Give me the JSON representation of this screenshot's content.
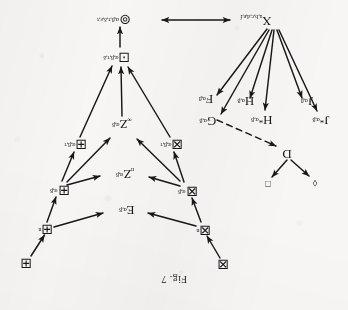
{
  "figure": {
    "caption": "Fig. 7",
    "orientation_degrees": 180,
    "ink_color": "#17171a",
    "paper_color": "#f7f6f4"
  },
  "nodes": {
    "box_x_top": {
      "symbol": "⊠",
      "sup": "",
      "sub": ""
    },
    "box_x_n": {
      "symbol": "⊠",
      "sup": "n",
      "sub": ""
    },
    "box_x_ab": {
      "symbol": "⊠",
      "sup": "α,β",
      "sub": ""
    },
    "box_x_abt": {
      "symbol": "⊠",
      "sup": "α,β,τ",
      "sub": ""
    },
    "box_plus_top": {
      "symbol": "⊞",
      "sup": "",
      "sub": ""
    },
    "box_plus_n": {
      "symbol": "⊞",
      "sup": "n",
      "sub": ""
    },
    "box_plus_ab": {
      "symbol": "⊞",
      "sup": "α,β",
      "sub": ""
    },
    "box_plus_abt": {
      "symbol": "⊞",
      "sup": "α,β,τ",
      "sub": ""
    },
    "e_ab": {
      "symbol": "E",
      "sup": "α,β",
      "sub": ""
    },
    "z_n_ab": {
      "symbol": "Z",
      "sup": "α,β",
      "sub": "n"
    },
    "z_inf_ab": {
      "symbol": "Z",
      "sup": "α,β",
      "sub": "∞"
    },
    "box_dot": {
      "symbol": "⊡",
      "sup": "α,β,τ,δ",
      "sub": ""
    },
    "circ_dot": {
      "symbol": "⊚",
      "sup": "α,β,τ,δ,ε,τ",
      "sub": ""
    },
    "x_node": {
      "symbol": "X",
      "sup": "",
      "sub": "a,b,c,d,e,f"
    },
    "d_node": {
      "symbol": "D",
      "sup": "",
      "sub": ""
    },
    "diamond_small": {
      "symbol": "◊",
      "sup": "",
      "sub": ""
    },
    "square_small": {
      "symbol": "□",
      "sup": "",
      "sub": ""
    },
    "f_ab": {
      "symbol": "F",
      "sup": "α,β",
      "sub": ""
    },
    "g_ab": {
      "symbol": "G",
      "sup": "α,β",
      "sub": ""
    },
    "h_ab": {
      "symbol": "H",
      "sup": "α,β",
      "sub": ""
    },
    "h_star_ab": {
      "symbol": "H*",
      "sup": "α,β",
      "sub": ""
    },
    "j_ab": {
      "symbol": "J",
      "sup": "α,β",
      "sub": ""
    },
    "j_star_ab": {
      "symbol": "J*",
      "sup": "α,β",
      "sub": ""
    }
  },
  "node_labels": {
    "box_x_top": "⊠",
    "box_x_n": "⊠",
    "box_x_ab": "⊠",
    "box_x_abt": "⊠",
    "box_plus_top": "⊞",
    "box_plus_n": "⊞",
    "box_plus_ab": "⊞",
    "box_plus_abt": "⊞",
    "box_dot": "⊡",
    "circ_dot": "⊚",
    "e_ab": "E",
    "z_n_ab": "Z",
    "z_inf_ab": "Z",
    "x_node": "X",
    "d_node": "D",
    "diamond_small": "◊",
    "square_small": "□",
    "f_ab": "F",
    "g_ab": "G",
    "h_ab": "H",
    "h_star_ab": "H",
    "j_ab": "J",
    "j_star_ab": "J"
  },
  "scripts": {
    "n": "n",
    "ab": "α,β",
    "abt": "α,β,τ",
    "abtd": "α,β,τ,δ",
    "abtdet": "α,β,τ,δ,ε,τ",
    "infinity": "∞",
    "xsub": "a,b,c,d,e,f",
    "star": "*"
  },
  "edges": [
    {
      "from": "box_x_top",
      "to": "box_x_n",
      "style": "solid",
      "heads": "single"
    },
    {
      "from": "box_x_n",
      "to": "e_ab",
      "style": "solid",
      "heads": "single"
    },
    {
      "from": "box_x_n",
      "to": "box_x_ab",
      "style": "solid",
      "heads": "single"
    },
    {
      "from": "box_plus_top",
      "to": "box_plus_n",
      "style": "solid",
      "heads": "single"
    },
    {
      "from": "box_plus_n",
      "to": "e_ab",
      "style": "solid",
      "heads": "single"
    },
    {
      "from": "box_plus_n",
      "to": "box_plus_ab",
      "style": "solid",
      "heads": "single"
    },
    {
      "from": "box_x_ab",
      "to": "z_n_ab",
      "style": "solid",
      "heads": "single"
    },
    {
      "from": "box_x_ab",
      "to": "box_x_abt",
      "style": "solid",
      "heads": "single"
    },
    {
      "from": "box_x_ab",
      "to": "z_inf_ab",
      "style": "solid",
      "heads": "single"
    },
    {
      "from": "box_plus_ab",
      "to": "z_n_ab",
      "style": "solid",
      "heads": "single"
    },
    {
      "from": "box_plus_ab",
      "to": "z_inf_ab",
      "style": "solid",
      "heads": "single"
    },
    {
      "from": "box_plus_ab",
      "to": "box_plus_abt",
      "style": "solid",
      "heads": "single"
    },
    {
      "from": "box_x_abt",
      "to": "box_dot",
      "style": "solid",
      "heads": "single"
    },
    {
      "from": "z_inf_ab",
      "to": "box_dot",
      "style": "solid",
      "heads": "single"
    },
    {
      "from": "box_plus_abt",
      "to": "box_dot",
      "style": "solid",
      "heads": "single"
    },
    {
      "from": "box_dot",
      "to": "circ_dot",
      "style": "solid",
      "heads": "single"
    },
    {
      "from": "x_node",
      "to": "circ_dot",
      "style": "solid",
      "heads": "double"
    },
    {
      "from": "x_node",
      "to": "f_ab",
      "style": "solid",
      "heads": "single"
    },
    {
      "from": "x_node",
      "to": "g_ab",
      "style": "solid",
      "heads": "single"
    },
    {
      "from": "x_node",
      "to": "h_ab",
      "style": "solid",
      "heads": "single"
    },
    {
      "from": "x_node",
      "to": "h_star_ab",
      "style": "solid",
      "heads": "single"
    },
    {
      "from": "x_node",
      "to": "j_ab",
      "style": "solid",
      "heads": "single"
    },
    {
      "from": "x_node",
      "to": "j_star_ab",
      "style": "solid",
      "heads": "single"
    },
    {
      "from": "g_ab",
      "to": "d_node",
      "style": "dashed",
      "heads": "single"
    },
    {
      "from": "d_node",
      "to": "diamond_small",
      "style": "solid",
      "heads": "single"
    },
    {
      "from": "d_node",
      "to": "square_small",
      "style": "solid",
      "heads": "single"
    }
  ]
}
